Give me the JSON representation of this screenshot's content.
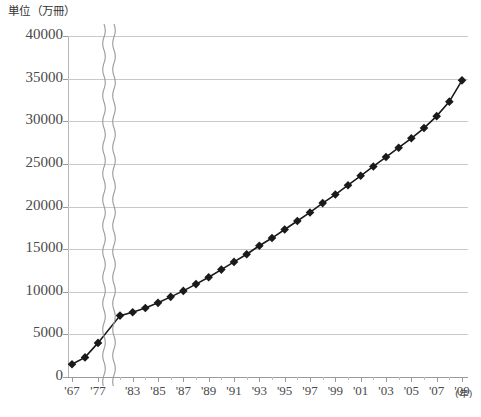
{
  "chart_data": {
    "type": "line",
    "title": "",
    "ylabel": "単位（万冊）",
    "xlabel": "(年)",
    "ylim": [
      0,
      40000
    ],
    "ytick_values": [
      0,
      5000,
      10000,
      15000,
      20000,
      25000,
      30000,
      35000,
      40000
    ],
    "ytick_labels": [
      "0",
      "5000",
      "10000",
      "15000",
      "20000",
      "25000",
      "30000",
      "35000",
      "40000"
    ],
    "grid": true,
    "legend": null,
    "axis_break": {
      "present": true,
      "style": "wavy-double-vertical",
      "between": [
        "'77",
        "'83"
      ]
    },
    "marker": "filled-diamond",
    "line_color": "#1a1a1a",
    "grid_color": "#c9c9c9",
    "xtick_labels": [
      "'67",
      "'77",
      "'83",
      "'85",
      "'87",
      "'89",
      "'91",
      "'93",
      "'95",
      "'97",
      "'99",
      "'01",
      "'03",
      "'05",
      "'07",
      "'09"
    ],
    "categories": [
      "'67",
      "'72",
      "'77",
      "'82",
      "'83",
      "'84",
      "'85",
      "'86",
      "'87",
      "'88",
      "'89",
      "'90",
      "'91",
      "'92",
      "'93",
      "'94",
      "'95",
      "'96",
      "'97",
      "'98",
      "'99",
      "'00",
      "'01",
      "'02",
      "'03",
      "'04",
      "'05",
      "'06",
      "'07",
      "'08",
      "'09"
    ],
    "values": [
      1500,
      2300,
      4000,
      7200,
      7600,
      8100,
      8700,
      9400,
      10100,
      10900,
      11700,
      12600,
      13500,
      14400,
      15400,
      16300,
      17300,
      18300,
      19300,
      20400,
      21400,
      22500,
      23600,
      24700,
      25800,
      26900,
      28000,
      29200,
      30600,
      32300,
      34800
    ]
  },
  "axes": {
    "y_caption": "単位（万冊）",
    "x_caption": "(年)"
  }
}
